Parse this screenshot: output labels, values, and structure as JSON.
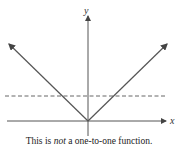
{
  "diagram": {
    "x_axis_label": "x",
    "y_axis_label": "y",
    "function": "y = |x|",
    "horizontal_line": "dashed horizontal line intersecting the graph at two points",
    "caption": {
      "prefix": "This is ",
      "emphasis": "not",
      "suffix": " a one-to-one function."
    },
    "colors": {
      "lines": "#555555",
      "background": "#ffffff"
    }
  }
}
